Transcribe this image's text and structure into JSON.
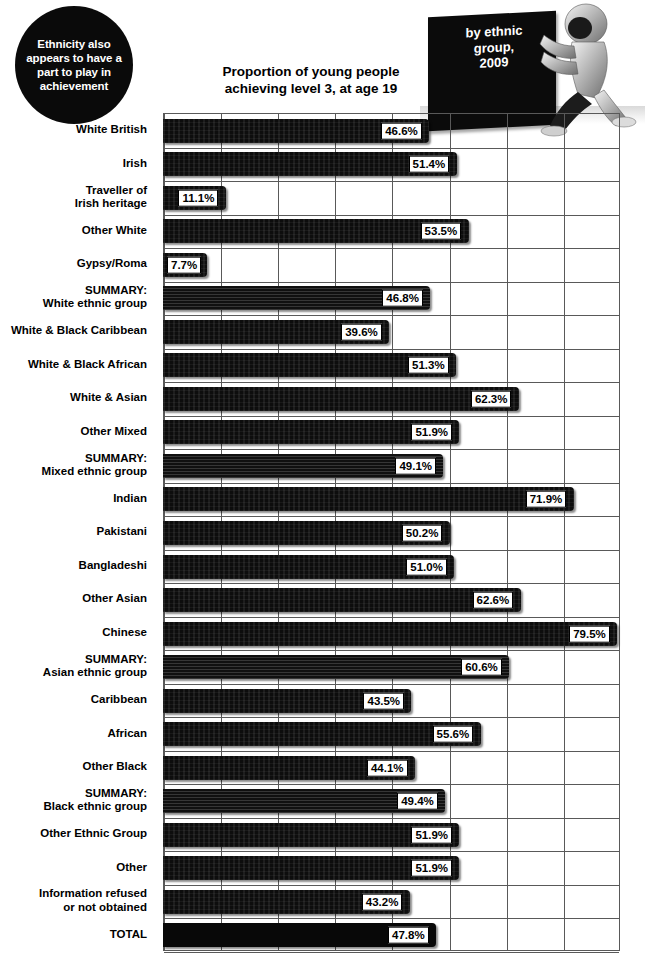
{
  "callout": {
    "text": "Ethnicity also appears to have a part to play in achievement"
  },
  "block_badge": {
    "text": "by ethnic\ngroup,\n2009",
    "icon": "pushing-figure-illustration"
  },
  "chart_data": {
    "type": "bar",
    "orientation": "horizontal",
    "title": "Proportion of young people\nachieving level 3, at age 19",
    "xlabel": "",
    "ylabel": "",
    "xlim": [
      0,
      80
    ],
    "grid": true,
    "gridline_step": 10,
    "legend": "none",
    "value_suffix": "%",
    "categories": [
      "White British",
      "Irish",
      "Traveller of\nIrish heritage",
      "Other White",
      "Gypsy/Roma",
      "SUMMARY:\nWhite ethnic group",
      "White & Black Caribbean",
      "White & Black African",
      "White & Asian",
      "Other Mixed",
      "SUMMARY:\nMixed ethnic group",
      "Indian",
      "Pakistani",
      "Bangladeshi",
      "Other Asian",
      "Chinese",
      "SUMMARY:\nAsian ethnic group",
      "Caribbean",
      "African",
      "Other Black",
      "SUMMARY:\nBlack ethnic group",
      "Other Ethnic Group",
      "Other",
      "Information refused\nor not obtained",
      "TOTAL"
    ],
    "values": [
      46.6,
      51.4,
      11.1,
      53.5,
      7.7,
      46.8,
      39.6,
      51.3,
      62.3,
      51.9,
      49.1,
      71.9,
      50.2,
      51.0,
      62.6,
      79.5,
      60.6,
      43.5,
      55.6,
      44.1,
      49.4,
      51.9,
      51.9,
      43.2,
      47.8
    ],
    "labels": [
      "46.6%",
      "51.4%",
      "11.1%",
      "53.5%",
      "7.7%",
      "46.8%",
      "39.6%",
      "51.3%",
      "62.3%",
      "51.9%",
      "49.1%",
      "71.9%",
      "50.2%",
      "51.0%",
      "62.6%",
      "79.5%",
      "60.6%",
      "43.5%",
      "55.6%",
      "44.1%",
      "49.4%",
      "51.9%",
      "51.9%",
      "43.2%",
      "47.8%"
    ],
    "styles": [
      "noise",
      "noise",
      "noise",
      "noise",
      "noise",
      "lines",
      "noise",
      "noise",
      "noise",
      "noise",
      "lines",
      "noise",
      "noise",
      "noise",
      "noise",
      "noise",
      "lines",
      "noise",
      "noise",
      "noise",
      "lines",
      "noise",
      "noise",
      "noise",
      "plain"
    ],
    "colors": {
      "bar": "#0d0d0d",
      "grid": "#595959",
      "label_bg": "#ffffff",
      "label_text": "#000000",
      "background": "#ffffff"
    }
  }
}
